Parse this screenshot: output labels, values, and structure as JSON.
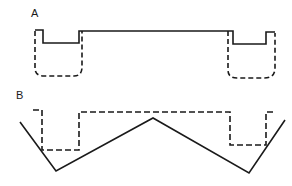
{
  "panels": {
    "a": {
      "label": "A",
      "solid_path": "M35,30 L43,30 L43,43 L79,43 L79,31 L229,31 L233,31 L233,44 L266,44 L266,32 L275,32",
      "dashed_left_path": "M35,31 L35,68 Q35,76 44,76 L74,76 Q82,76 82,67 L82,31",
      "dashed_right_path": "M228,31 L228,70 Q228,78 237,78 L264,78 Q275,78 275,68 L275,33"
    },
    "b": {
      "label": "B",
      "dashed_path": "M33,110 L42,110 L42,150 L79,150 L79,112 L230,112 L230,145 L266,145 L266,112 L275,112",
      "solid_path": "M20,122 L56,171 L153,118 L249,173 L285,120"
    }
  },
  "colors": {
    "stroke": "#1a1a1a",
    "background": "#ffffff"
  }
}
